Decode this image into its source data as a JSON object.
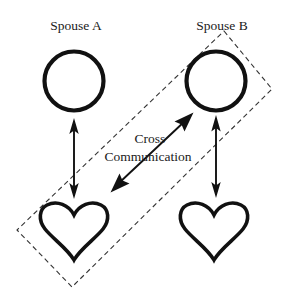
{
  "diagram": {
    "title_visible": false,
    "canvas": {
      "width": 290,
      "height": 299,
      "background": "#ffffff"
    },
    "colors": {
      "stroke": "#111111",
      "dashed_frame": "#333333",
      "text": "#1a1a1a",
      "background": "#ffffff"
    },
    "labels": {
      "spouse_a": "Spouse A",
      "spouse_b": "Spouse B",
      "cross_line1": "Cross",
      "cross_line2": "Communication"
    },
    "nodes": [
      {
        "id": "spouse-a-circle",
        "icon": "circle-outline",
        "shape": "circle",
        "cx": 74,
        "cy": 81,
        "r": 29.5,
        "stroke_width": 4.2,
        "belongs_to": "Spouse A"
      },
      {
        "id": "spouse-b-circle",
        "icon": "circle-outline",
        "shape": "circle",
        "cx": 216,
        "cy": 81,
        "r": 29.5,
        "stroke_width": 4.2,
        "belongs_to": "Spouse B"
      },
      {
        "id": "spouse-a-heart",
        "icon": "heart-outline",
        "shape": "heart",
        "cx": 74,
        "cy": 231,
        "width": 66,
        "height": 60,
        "stroke_width": 3.6,
        "belongs_to": "Spouse A"
      },
      {
        "id": "spouse-b-heart",
        "icon": "heart-outline",
        "shape": "heart",
        "cx": 214,
        "cy": 231,
        "width": 66,
        "height": 60,
        "stroke_width": 3.6,
        "belongs_to": "Spouse B"
      }
    ],
    "connectors": [
      {
        "id": "spouse-a-internal-arrow",
        "type": "double-headed-arrow",
        "orientation": "vertical",
        "x1": 74,
        "y1": 196,
        "x2": 74,
        "y2": 121,
        "label": ""
      },
      {
        "id": "spouse-b-internal-arrow",
        "type": "double-headed-arrow",
        "orientation": "vertical",
        "x1": 216,
        "y1": 196,
        "x2": 216,
        "y2": 119,
        "label": ""
      },
      {
        "id": "cross-communication-arrow",
        "type": "double-headed-arrow",
        "orientation": "diagonal",
        "x1": 112,
        "y1": 190,
        "x2": 192,
        "y2": 114,
        "label": "Cross Communication"
      }
    ],
    "frame": {
      "id": "cross-communication-frame",
      "type": "dashed-rotated-rectangle",
      "corners": [
        {
          "x": 224,
          "y": 31
        },
        {
          "x": 272,
          "y": 89
        },
        {
          "x": 72,
          "y": 287
        },
        {
          "x": 17,
          "y": 230
        }
      ],
      "encloses": [
        "Spouse B circle",
        "Spouse A heart",
        "Cross Communication arrow"
      ]
    },
    "text_positions": {
      "spouse_a": {
        "x": 76,
        "y": 30
      },
      "spouse_b": {
        "x": 222,
        "y": 30
      },
      "cross_line1": {
        "x": 150,
        "y": 143
      },
      "cross_line2": {
        "x": 148,
        "y": 161
      }
    }
  }
}
